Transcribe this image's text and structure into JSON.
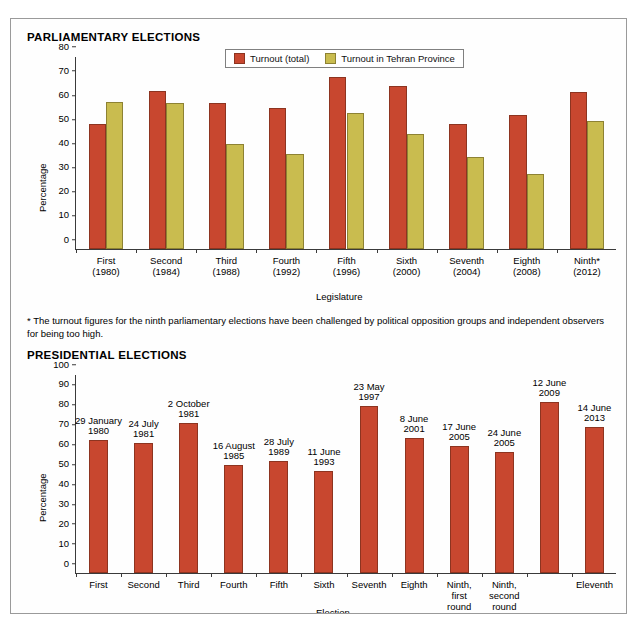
{
  "page": {
    "parliamentary_title": "PARLIAMENTARY ELECTIONS",
    "presidential_title": "PRESIDENTIAL ELECTIONS",
    "footnote": "* The turnout figures for the ninth parliamentary elections have been challenged by political opposition groups and independent observers for being too high."
  },
  "colors": {
    "turnout_total": "#c8472f",
    "turnout_tehran": "#c9bc4f",
    "axis": "#3a3a3a",
    "frame": "#9a9a9a"
  },
  "chart_data": [
    {
      "type": "bar",
      "id": "parliamentary",
      "title": "PARLIAMENTARY ELECTIONS",
      "xlabel": "Legislature",
      "ylabel": "Percentage",
      "ylim": [
        0,
        80
      ],
      "yticks": [
        0,
        10,
        20,
        30,
        40,
        50,
        60,
        70,
        80
      ],
      "grid": false,
      "legend_position": "top-center",
      "categories": [
        "First\n(1980)",
        "Second\n(1984)",
        "Third\n(1988)",
        "Fourth\n(1992)",
        "Fifth\n(1996)",
        "Sixth\n(2000)",
        "Seventh\n(2004)",
        "Eighth\n(2008)",
        "Ninth*\n(2012)"
      ],
      "series": [
        {
          "name": "Turnout (total)",
          "color": "#c8472f",
          "values": [
            52.0,
            65.5,
            60.5,
            58.5,
            71.5,
            67.5,
            52.0,
            55.5,
            65.0
          ]
        },
        {
          "name": "Turnout in Tehran Province",
          "color": "#c9bc4f",
          "values": [
            61.0,
            60.5,
            43.5,
            39.5,
            56.5,
            47.5,
            38.0,
            31.0,
            53.0
          ]
        }
      ]
    },
    {
      "type": "bar",
      "id": "presidential",
      "title": "PRESIDENTIAL ELECTIONS",
      "xlabel": "Election",
      "ylabel": "Percentage",
      "ylim": [
        0,
        100
      ],
      "yticks": [
        0,
        10,
        20,
        30,
        40,
        50,
        60,
        70,
        80,
        90,
        100
      ],
      "grid": false,
      "categories": [
        "First",
        "Second",
        "Third",
        "Fourth",
        "Fifth",
        "Sixth",
        "Seventh",
        "Eighth",
        "Ninth,\nfirst\nround",
        "Ninth,\nsecond\nround",
        "",
        "Eleventh"
      ],
      "point_labels": [
        "29 January\n1980",
        "24 July\n1981",
        "2 October\n1981",
        "16 August\n1985",
        "28 July\n1989",
        "11 June\n1993",
        "23 May\n1997",
        "8 June\n2001",
        "17 June\n2005",
        "24 June\n2005",
        "12 June\n2009",
        "14 June\n2013"
      ],
      "series": [
        {
          "name": "Turnout",
          "color": "#c8472f",
          "values": [
            67.0,
            65.5,
            75.5,
            54.5,
            56.5,
            51.5,
            84.0,
            68.0,
            64.0,
            61.0,
            86.0,
            73.5
          ]
        }
      ]
    }
  ]
}
